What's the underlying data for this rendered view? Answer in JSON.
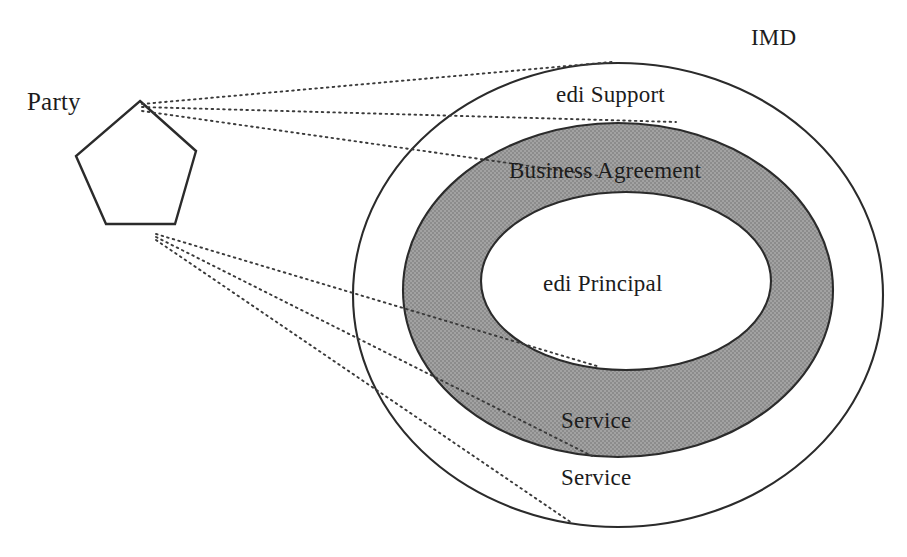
{
  "diagram": {
    "title": "IMD",
    "type": "concentric-ellipse-venn-with-actor",
    "actor": {
      "shape": "pentagon",
      "label": "Party"
    },
    "outer_container_label": "IMD",
    "rings": [
      {
        "name": "outer-ring",
        "label": "edi Support",
        "fill": "#ffffff"
      },
      {
        "name": "middle-ring",
        "label": "Business Agreement",
        "fill": "#9a9a9a"
      },
      {
        "name": "inner-core",
        "label": "edi Principal",
        "fill": "#ffffff"
      }
    ],
    "service_labels": {
      "inner": "Service",
      "outer": "Service"
    },
    "colors": {
      "stroke": "#2b2b2b",
      "shaded_band": "#9a9a9a",
      "background": "#ffffff",
      "text": "#1c1c1c",
      "connector": "#3a3a3a"
    },
    "connectors": {
      "count": 6,
      "style": "dotted",
      "from_apex": 3,
      "from_base": 3
    }
  }
}
